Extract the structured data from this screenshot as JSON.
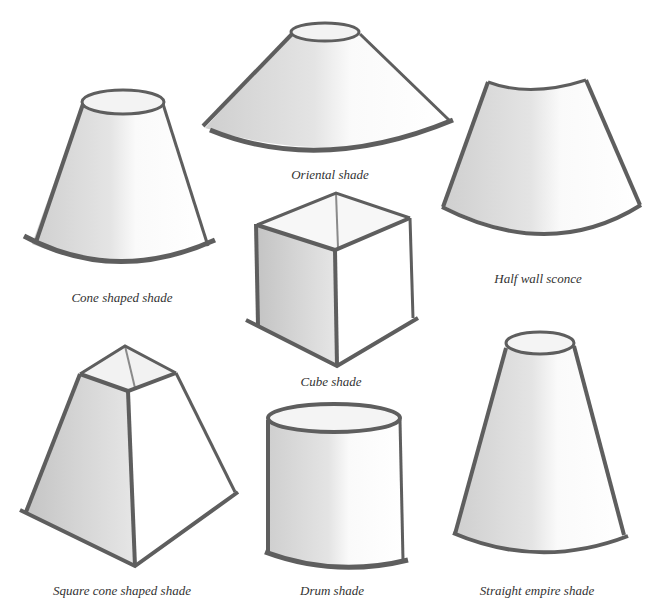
{
  "illustration": {
    "background": "#ffffff",
    "stroke_color": "#5e5e5e",
    "shadow_color": "#cfcfcf",
    "shades": [
      {
        "id": "cone",
        "caption": "Cone shaped shade"
      },
      {
        "id": "oriental",
        "caption": "Oriental shade"
      },
      {
        "id": "half-wall",
        "caption": "Half wall sconce"
      },
      {
        "id": "cube",
        "caption": "Cube shade"
      },
      {
        "id": "square-cone",
        "caption": "Square cone shaped shade"
      },
      {
        "id": "drum",
        "caption": "Drum shade"
      },
      {
        "id": "straight-empire",
        "caption": "Straight empire shade"
      }
    ]
  }
}
